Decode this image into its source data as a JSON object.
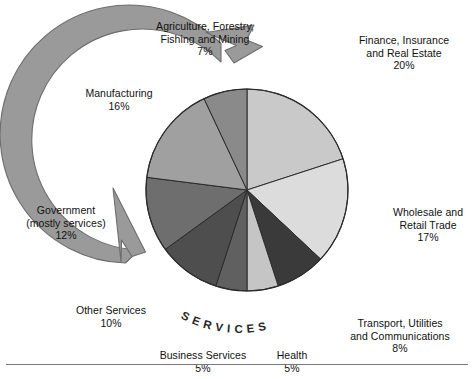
{
  "chart_data": {
    "type": "pie",
    "title": "",
    "subtitle": "",
    "xlabel": "",
    "ylabel": "",
    "legend_position": "callout-labels",
    "grid": false,
    "ring_annotation": "S E R V I C E S",
    "ring_annotation_plain": "SERVICES",
    "unit": "%",
    "total": 100,
    "categories": [
      "Finance, Insurance and Real Estate",
      "Wholesale and Retail Trade",
      "Transport, Utilities and Communications",
      "Health",
      "Business Services",
      "Other Services",
      "Government (mostly services)",
      "Manufacturing",
      "Agriculture, Forestry, Fishing and Mining"
    ],
    "values": [
      20,
      17,
      8,
      5,
      5,
      10,
      12,
      16,
      7
    ],
    "colors": [
      "#c9c9c9",
      "#dcdcdc",
      "#3a3a3a",
      "#c5c5c5",
      "#606060",
      "#4e4e4e",
      "#6e6e6e",
      "#a0a0a0",
      "#8a8a8a"
    ],
    "slices": [
      {
        "label": "Finance, Insurance and Real Estate",
        "value": 20,
        "pct_text": "20%",
        "color": "#c9c9c9",
        "start_deg": 0,
        "end_deg": 72
      },
      {
        "label": "Wholesale and Retail Trade",
        "value": 17,
        "pct_text": "17%",
        "color": "#dcdcdc",
        "start_deg": 72,
        "end_deg": 133.2
      },
      {
        "label": "Transport, Utilities and Communications",
        "value": 8,
        "pct_text": "8%",
        "color": "#3a3a3a",
        "start_deg": 133.2,
        "end_deg": 162
      },
      {
        "label": "Health",
        "value": 5,
        "pct_text": "5%",
        "color": "#c5c5c5",
        "start_deg": 162,
        "end_deg": 180
      },
      {
        "label": "Business Services",
        "value": 5,
        "pct_text": "5%",
        "color": "#606060",
        "start_deg": 180,
        "end_deg": 198
      },
      {
        "label": "Other Services",
        "value": 10,
        "pct_text": "10%",
        "color": "#4e4e4e",
        "start_deg": 198,
        "end_deg": 234
      },
      {
        "label": "Government (mostly services)",
        "value": 12,
        "pct_text": "12%",
        "color": "#6e6e6e",
        "start_deg": 234,
        "end_deg": 277.2
      },
      {
        "label": "Manufacturing",
        "value": 16,
        "pct_text": "16%",
        "color": "#a0a0a0",
        "start_deg": 277.2,
        "end_deg": 334.8
      },
      {
        "label": "Agriculture, Forestry, Fishing and Mining",
        "value": 7,
        "pct_text": "7%",
        "color": "#8a8a8a",
        "start_deg": 334.8,
        "end_deg": 360
      }
    ]
  },
  "labels": {
    "agriculture": {
      "name": "Agriculture, Forestry,\nFishing and Mining",
      "pct": "7%"
    },
    "finance": {
      "name": "Finance, Insurance\nand Real Estate",
      "pct": "20%"
    },
    "manufacturing": {
      "name": "Manufacturing",
      "pct": "16%"
    },
    "wholesale": {
      "name": "Wholesale and\nRetail Trade",
      "pct": "17%"
    },
    "government": {
      "name": "Government\n(mostly services)",
      "pct": "12%"
    },
    "transport": {
      "name": "Transport, Utilities\nand Communications",
      "pct": "8%"
    },
    "other_services": {
      "name": "Other Services",
      "pct": "10%"
    },
    "business_services": {
      "name": "Business Services",
      "pct": "5%"
    },
    "health": {
      "name": "Health",
      "pct": "5%"
    }
  },
  "ring": {
    "text": "S E R V I C E S",
    "color": "#9a9a9a",
    "stroke": "#6d6d6d"
  },
  "style": {
    "background": "#ffffff",
    "text_color": "#111111",
    "rule_color": "#7a7a7a"
  }
}
